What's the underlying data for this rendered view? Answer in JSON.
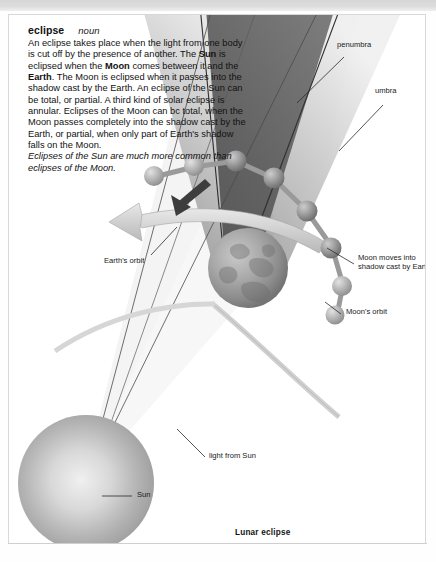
{
  "page": {
    "frame_color": "#d8d8d8",
    "background": "#ffffff",
    "folio": ""
  },
  "entry": {
    "headword": "eclipse",
    "part_of_speech": "noun",
    "definition_runs": [
      {
        "text": "An eclipse takes place when the light from one body is cut off by the presence of another. The ",
        "style": "normal"
      },
      {
        "text": "Sun",
        "style": "bold"
      },
      {
        "text": " is eclipsed when the ",
        "style": "normal"
      },
      {
        "text": "Moon",
        "style": "bold"
      },
      {
        "text": " comes between it and the ",
        "style": "normal"
      },
      {
        "text": "Earth",
        "style": "bold"
      },
      {
        "text": ". The Moon is eclipsed when it passes into the shadow cast by the Earth. An eclipse of the Sun can be total, or partial. A third kind of solar eclipse is annular. Eclipses of the Moon can bc total, when the Moon passes completely into the shadow cast by the Earth, or partial, when only part of Earth's shadow falls on the Moon.",
        "style": "normal"
      }
    ],
    "note": "Eclipses of the Sun are much more common than eclipses of the Moon."
  },
  "diagram": {
    "caption": "Lunar eclipse",
    "labels": [
      {
        "id": "penumbra",
        "text": "penumbra"
      },
      {
        "id": "umbra",
        "text": "umbra"
      },
      {
        "id": "earths-orbit",
        "text": "Earth's orbit"
      },
      {
        "id": "moon-shadow",
        "text": "Moon moves into shadow cast by Earth"
      },
      {
        "id": "moons-orbit",
        "text": "Moon's orbit"
      },
      {
        "id": "light-from-sun",
        "text": "light from Sun"
      },
      {
        "id": "sun",
        "text": "Sun"
      }
    ],
    "colors": {
      "umbra": "#6b6b6b",
      "penumbra": "#bfbfbf",
      "light_cone": "#f2f2f2",
      "sun": "#b7b7b7",
      "earth": "#9a9a9a",
      "moon": "#b0b0b0",
      "orbit_arrow": "#cccccc",
      "leader_line": "#2a2a2a"
    }
  }
}
